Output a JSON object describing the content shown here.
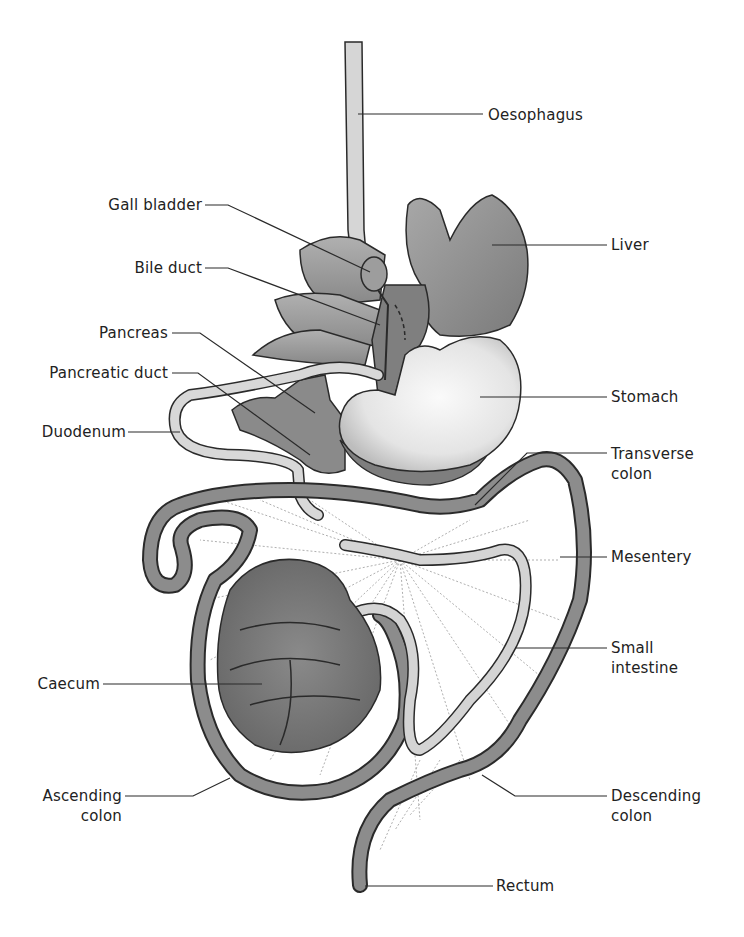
{
  "diagram": {
    "colors": {
      "background": "#ffffff",
      "outline": "#2a2a2a",
      "liver": "#8e8e8e",
      "stomach": "#e6e6e6",
      "colon": "#8c8c8c",
      "small_intestine": "#d0d0d0",
      "caecum": "#777777",
      "pancreas": "#888888",
      "mesentery_lines": "#9a9a9a",
      "label_text": "#222222"
    },
    "labels": {
      "oesophagus": "Oesophagus",
      "gall_bladder": "Gall bladder",
      "liver": "Liver",
      "bile_duct": "Bile duct",
      "pancreas": "Pancreas",
      "pancreatic_duct": "Pancreatic duct",
      "stomach": "Stomach",
      "duodenum": "Duodenum",
      "transverse_colon": [
        "Transverse",
        "colon"
      ],
      "mesentery": "Mesentery",
      "small_intestine": [
        "Small",
        "intestine"
      ],
      "caecum": "Caecum",
      "ascending_colon": [
        "Ascending",
        "colon"
      ],
      "descending_colon": [
        "Descending",
        "colon"
      ],
      "rectum": "Rectum"
    }
  }
}
